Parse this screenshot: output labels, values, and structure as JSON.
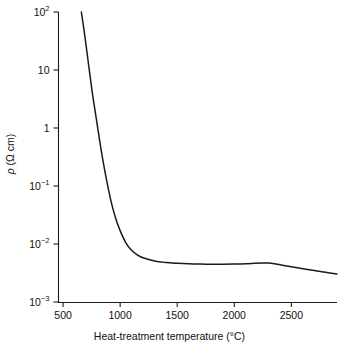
{
  "chart_data": {
    "type": "line",
    "title": "",
    "xlabel": "Heat-treatment temperature  (°C)",
    "ylabel": "ρ (Ω cm)",
    "yscale": "log",
    "xscale": "linear",
    "xlim": [
      460,
      2900
    ],
    "ylim": [
      0.001,
      100
    ],
    "grid": false,
    "legend": null,
    "xticks": [
      500,
      1000,
      1500,
      2000,
      2500
    ],
    "xtick_labels": [
      "500",
      "1000",
      "1500",
      "2000",
      "2500"
    ],
    "yticks": [
      100,
      10,
      1,
      0.1,
      0.01,
      0.001
    ],
    "ytick_labels": [
      "10²",
      "10",
      "1",
      "10⁻¹",
      "10⁻²",
      "10⁻³"
    ],
    "series": [
      {
        "name": "resistivity",
        "color": "#1a1a1a",
        "x": [
          660,
          680,
          700,
          720,
          740,
          760,
          790,
          820,
          850,
          880,
          920,
          960,
          1000,
          1050,
          1100,
          1150,
          1200,
          1300,
          1400,
          1500,
          1600,
          1700,
          1800,
          1900,
          2000,
          2100,
          2180,
          2250,
          2300,
          2350,
          2420,
          2500,
          2600,
          2700,
          2800,
          2900
        ],
        "y": [
          100,
          55,
          28,
          14,
          7.0,
          3.6,
          1.5,
          0.62,
          0.27,
          0.13,
          0.055,
          0.028,
          0.017,
          0.0105,
          0.0078,
          0.0065,
          0.0058,
          0.0051,
          0.0048,
          0.00465,
          0.00455,
          0.0045,
          0.00448,
          0.00448,
          0.0045,
          0.00455,
          0.00465,
          0.00472,
          0.0047,
          0.00458,
          0.00432,
          0.00405,
          0.00375,
          0.00348,
          0.00325,
          0.00305
        ]
      }
    ]
  },
  "axes": {
    "ytick_main": [
      "10",
      "10",
      "1",
      "10",
      "10",
      "10"
    ],
    "ytick_sup": [
      "2",
      "",
      "",
      "−1",
      "−2",
      "−3"
    ]
  }
}
